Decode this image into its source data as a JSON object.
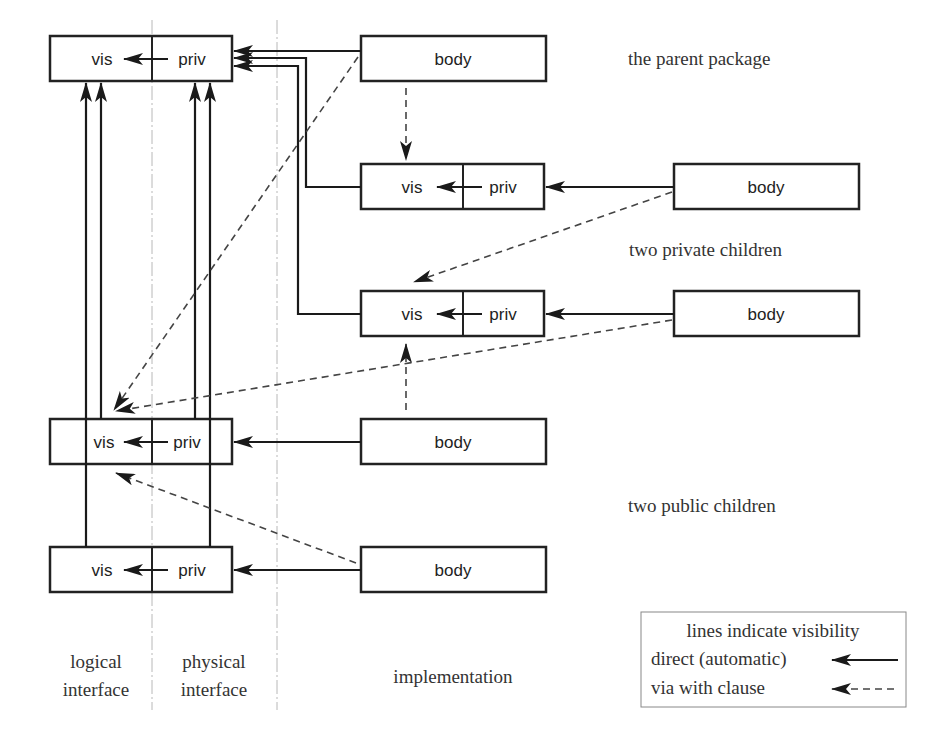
{
  "diagram": {
    "colors": {
      "line": "#1a1a1a",
      "dashed": "#444444",
      "zone_divider": "#b8b8b8",
      "text": "#333333"
    },
    "packages": {
      "parent": {
        "spec_visible": "vis",
        "spec_private": "priv",
        "body": "body"
      },
      "private_child_1": {
        "spec_visible": "vis",
        "spec_private": "priv",
        "body": "body"
      },
      "private_child_2": {
        "spec_visible": "vis",
        "spec_private": "priv",
        "body": "body"
      },
      "public_child_1": {
        "spec_visible": "vis",
        "spec_private": "priv",
        "body": "body"
      },
      "public_child_2": {
        "spec_visible": "vis",
        "spec_private": "priv",
        "body": "body"
      }
    },
    "group_labels": {
      "parent": "the parent package",
      "private_children": "two private children",
      "public_children": "two public children"
    },
    "zones": {
      "logical_1": "logical",
      "logical_2": "interface",
      "physical_1": "physical",
      "physical_2": "interface",
      "implementation": "implementation"
    },
    "legend": {
      "title": "lines indicate visibility",
      "direct": "direct (automatic)",
      "with_clause": "via with clause"
    }
  }
}
